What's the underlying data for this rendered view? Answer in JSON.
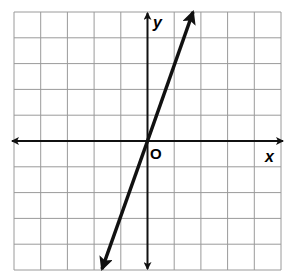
{
  "graph": {
    "x_axis_label": "x",
    "y_axis_label": "y",
    "origin_label": "O",
    "grid": {
      "columns": 10,
      "rows": 10,
      "x_range": [
        -5,
        5
      ],
      "y_range": [
        -5,
        5
      ]
    },
    "line": {
      "equation": "y = 3x",
      "slope": 3,
      "intercept": 0,
      "direction": "both-arrows"
    },
    "colors": {
      "grid": "#9a9a9a",
      "axes": "#111111",
      "line": "#111111",
      "background": "#ffffff"
    }
  },
  "chart_data": {
    "type": "line",
    "title": "",
    "xlabel": "x",
    "ylabel": "y",
    "xlim": [
      -5,
      5
    ],
    "ylim": [
      -5,
      5
    ],
    "grid": true,
    "series": [
      {
        "name": "y = 3x",
        "x": [
          -1.67,
          0,
          1.67
        ],
        "y": [
          -5,
          0,
          5
        ]
      }
    ]
  }
}
